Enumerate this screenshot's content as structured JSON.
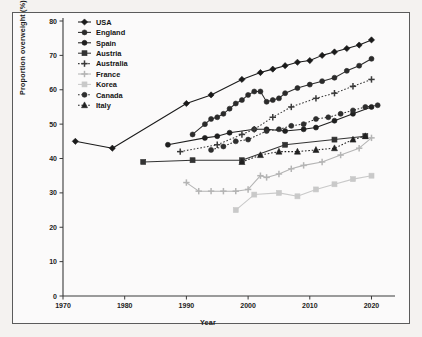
{
  "figure": {
    "background": "#f4f2f0",
    "plot_background": "#fbfafa",
    "border_color": "#5b5b5b"
  },
  "chart_data": {
    "type": "line",
    "title": "",
    "xlabel": "Year",
    "ylabel": "Proportion overweight (%)",
    "xlim": [
      1970,
      2023
    ],
    "ylim": [
      0,
      80
    ],
    "xticks": [
      1970,
      1980,
      1990,
      2000,
      2010,
      2020
    ],
    "yticks": [
      0,
      10,
      20,
      30,
      40,
      50,
      60,
      70,
      80
    ],
    "grid": false,
    "legend_position": "top-left",
    "series": [
      {
        "name": "USA",
        "color": "#1a1a1a",
        "marker": "diamond",
        "linestyle": "solid",
        "x": [
          1972,
          1978,
          1990,
          1994,
          1999,
          2002,
          2004,
          2006,
          2008,
          2010,
          2012,
          2014,
          2016,
          2018,
          2020
        ],
        "y": [
          45.0,
          43.0,
          56.0,
          58.5,
          63.0,
          65.0,
          66.0,
          67.0,
          68.0,
          68.5,
          70.0,
          71.0,
          72.0,
          73.0,
          74.5
        ]
      },
      {
        "name": "England",
        "color": "#2b2b2b",
        "marker": "circle",
        "linestyle": "solid",
        "x": [
          1991,
          1993,
          1994,
          1995,
          1996,
          1997,
          1998,
          1999,
          2000,
          2001,
          2002,
          2003,
          2004,
          2005,
          2006,
          2008,
          2010,
          2012,
          2014,
          2016,
          2018,
          2020
        ],
        "y": [
          47.0,
          50.0,
          51.5,
          52.0,
          53.0,
          54.5,
          56.0,
          57.0,
          58.5,
          59.5,
          59.5,
          56.5,
          57.0,
          57.5,
          59.0,
          60.5,
          61.5,
          62.5,
          63.5,
          65.5,
          67.0,
          69.0
        ]
      },
      {
        "name": "Spain",
        "color": "#1f1f1f",
        "marker": "circle",
        "linestyle": "solid",
        "x": [
          1987,
          1993,
          1995,
          1997,
          2001,
          2003,
          2006,
          2009,
          2011,
          2014,
          2017,
          2020
        ],
        "y": [
          44.0,
          46.0,
          46.5,
          47.5,
          48.5,
          48.5,
          48.0,
          48.5,
          49.0,
          51.0,
          53.0,
          55.0
        ]
      },
      {
        "name": "Austria",
        "color": "#333333",
        "marker": "square",
        "linestyle": "solid",
        "x": [
          1983,
          1991,
          1999,
          2006,
          2014,
          2019
        ],
        "y": [
          39.0,
          39.5,
          39.5,
          44.0,
          45.5,
          46.5
        ]
      },
      {
        "name": "Australia",
        "color": "#3a3a3a",
        "marker": "plus",
        "linestyle": "dotted",
        "x": [
          1989,
          1995,
          1999,
          2001,
          2004,
          2007,
          2011,
          2014,
          2017,
          2020
        ],
        "y": [
          42.0,
          44.0,
          47.0,
          48.5,
          52.0,
          55.0,
          57.5,
          59.0,
          61.0,
          63.0
        ]
      },
      {
        "name": "France",
        "color": "#b4b4b4",
        "marker": "plus",
        "linestyle": "solid",
        "x": [
          1990,
          1992,
          1994,
          1996,
          1998,
          2000,
          2002,
          2003,
          2005,
          2007,
          2009,
          2012,
          2015,
          2018,
          2020
        ],
        "y": [
          33.0,
          30.5,
          30.5,
          30.5,
          30.5,
          31.0,
          35.0,
          34.5,
          35.5,
          37.0,
          38.0,
          39.0,
          41.0,
          43.0,
          46.0
        ]
      },
      {
        "name": "Korea",
        "color": "#c9c9c9",
        "marker": "square",
        "linestyle": "solid",
        "x": [
          1998,
          2001,
          2005,
          2008,
          2011,
          2014,
          2017,
          2020
        ],
        "y": [
          25.0,
          29.5,
          30.0,
          29.0,
          31.0,
          32.5,
          34.0,
          35.0
        ]
      },
      {
        "name": "Canada",
        "color": "#2e2e2e",
        "marker": "circle",
        "linestyle": "dotted",
        "x": [
          1994,
          1996,
          1998,
          2000,
          2003,
          2005,
          2007,
          2009,
          2011,
          2013,
          2015,
          2017,
          2019,
          2021
        ],
        "y": [
          42.5,
          43.5,
          45.0,
          45.5,
          48.0,
          48.5,
          49.5,
          50.0,
          51.5,
          52.0,
          53.0,
          54.0,
          55.0,
          55.5
        ]
      },
      {
        "name": "Italy",
        "color": "#212121",
        "marker": "triangle",
        "linestyle": "dotted",
        "x": [
          1999,
          2002,
          2005,
          2008,
          2011,
          2014,
          2017,
          2019
        ],
        "y": [
          39.0,
          41.0,
          42.0,
          42.0,
          42.5,
          43.0,
          45.5,
          46.5
        ]
      }
    ]
  },
  "legend": {
    "entries": [
      {
        "label": "USA"
      },
      {
        "label": "England"
      },
      {
        "label": "Spain"
      },
      {
        "label": "Austria"
      },
      {
        "label": "Australia"
      },
      {
        "label": "France"
      },
      {
        "label": "Korea"
      },
      {
        "label": "Canada"
      },
      {
        "label": "Italy"
      }
    ]
  }
}
